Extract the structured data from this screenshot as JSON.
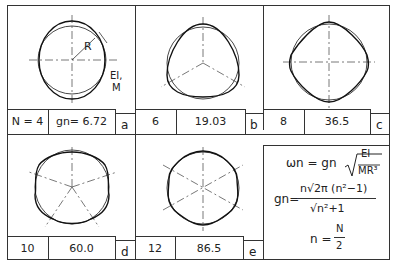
{
  "diagram": {
    "panels": [
      {
        "id": "a",
        "N_label": "N = 4",
        "g_label": "gn= 6.72",
        "N": 4,
        "g": 6.72,
        "lobes": 2
      },
      {
        "id": "b",
        "N_label": "6",
        "g_label": "19.03",
        "N": 6,
        "g": 19.03,
        "lobes": 3
      },
      {
        "id": "c",
        "N_label": "8",
        "g_label": "36.5",
        "N": 8,
        "g": 36.5,
        "lobes": 4
      },
      {
        "id": "d",
        "N_label": "10",
        "g_label": "60.0",
        "N": 10,
        "g": 60.0,
        "lobes": 5
      },
      {
        "id": "e",
        "N_label": "12",
        "g_label": "86.5",
        "N": 12,
        "g": 86.5,
        "lobes": 6
      }
    ],
    "annotations": {
      "radius": "R",
      "stiffness": "EI,",
      "mass": "M"
    },
    "formulas": {
      "omega_lhs": "ωn = gn",
      "omega_num": "EI",
      "omega_den": "MR³",
      "g_lhs": "gn=",
      "g_num": "n√2π (n²−1)",
      "g_den": "√n²+1",
      "n_lhs": "n =",
      "n_num": "N",
      "n_den": "2"
    }
  }
}
